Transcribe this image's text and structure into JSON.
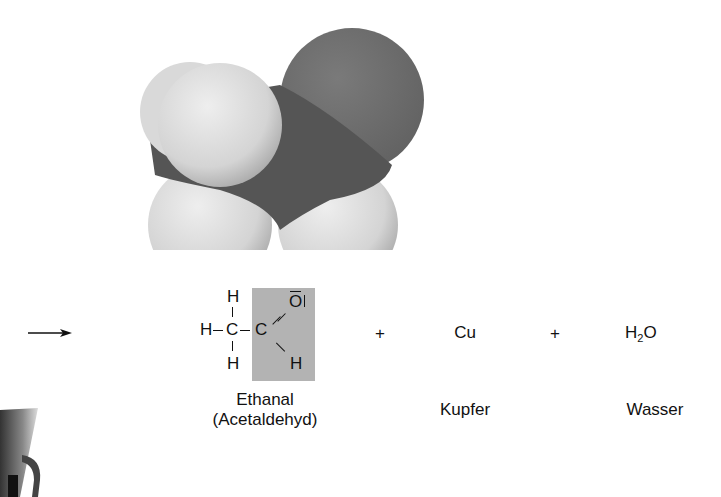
{
  "reaction": {
    "arrow": "→",
    "product1": {
      "name": "Ethanal",
      "synonym": "(Acetaldehyd)",
      "formula_atoms": {
        "h_top": "H",
        "h_left": "H",
        "c1": "C",
        "h_bottom": "H",
        "c2": "C",
        "o": "O",
        "o_lone_pair_bar": "‾",
        "o_lone_pair_side": "|",
        "h_aldehyde": "H"
      },
      "highlight_color": "#b3b3b3"
    },
    "plus1": "+",
    "product2": {
      "formula": "Cu",
      "name": "Kupfer"
    },
    "plus2": "+",
    "product3": {
      "formula_main": "H",
      "formula_sub": "2",
      "formula_end": "O",
      "name": "Wasser"
    }
  },
  "molecule_model": {
    "label": "space-filling model of ethanal",
    "colors": {
      "carbon": "#5a5a5a",
      "oxygen": "#6e6e6e",
      "hydrogen": "#dcdcdc"
    }
  }
}
